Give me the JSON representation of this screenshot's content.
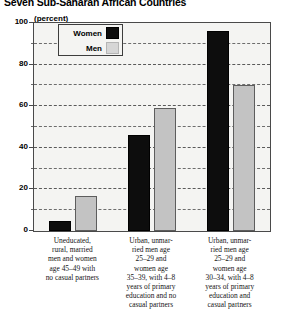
{
  "title": "Seven Sub-Saharan African Countries",
  "axis_caption": "(percent)",
  "legend": {
    "women_label": "Women",
    "men_label": "Men",
    "women_color": "#0d0d0d",
    "men_color": "#c3c3c3"
  },
  "yticks": [
    "0",
    "20",
    "40",
    "60",
    "80",
    "100"
  ],
  "chart_data": {
    "type": "bar",
    "title": "Seven Sub-Saharan African Countries",
    "xlabel": "",
    "ylabel": "(percent)",
    "ylim": [
      0,
      100
    ],
    "ytick_values": [
      0,
      20,
      40,
      60,
      80,
      100
    ],
    "grid": true,
    "grid_interval": 10,
    "legend_position": "top-left-inside",
    "categories": [
      "Uneducated, rural, married men and women age 45–49 with no casual partners",
      "Urban, unmar-ried men age 25–29 and women age 35–39, with 4–8 years of primary education and no casual partners",
      "Urban, unmar-ried men age 25–29 and women age 30–34, with 4–8 years of primary education and casual partners"
    ],
    "series": [
      {
        "name": "Women",
        "color": "#0d0d0d",
        "values": [
          5,
          46,
          96
        ]
      },
      {
        "name": "Men",
        "color": "#c3c3c3",
        "values": [
          17,
          59,
          70
        ]
      }
    ]
  },
  "category_lines": {
    "cat1": "Uneducated,\nrural, married\nmen and women\nage 45–49 with\nno casual partners",
    "cat2": "Urban, unmar-\nried men age\n25–29 and\nwomen age\n35–39, with 4–8\nyears of primary\neducation and no\ncasual partners",
    "cat3": "Urban, unmar-\nried men age\n25–29 and\nwomen age\n30–34, with 4–8\nyears of primary\neducation and\ncasual partners"
  }
}
